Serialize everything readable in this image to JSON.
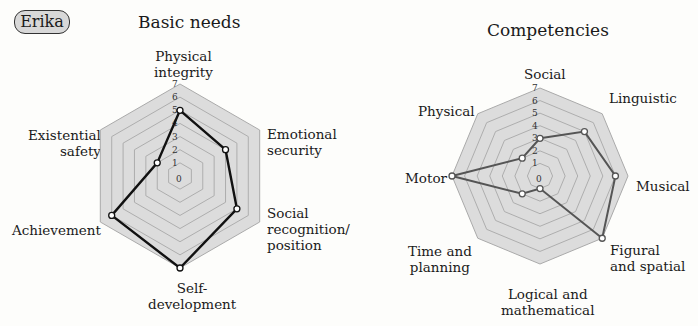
{
  "badge": {
    "label": "Erika"
  },
  "chart_data": [
    {
      "type": "radar",
      "title": "Basic needs",
      "categories": [
        "Physical integrity",
        "Emotional security",
        "Social recognition/ position",
        "Self-development",
        "Achievement",
        "Existential safety"
      ],
      "values": [
        5,
        4,
        5,
        7,
        6,
        2
      ],
      "rlim": [
        0,
        7
      ],
      "ticks": [
        0,
        1,
        2,
        3,
        4,
        5,
        6,
        7
      ],
      "line_color": "#111111",
      "grid": true,
      "legend": null
    },
    {
      "type": "radar",
      "title": "Competencies",
      "categories": [
        "Social",
        "Linguistic",
        "Musical",
        "Figural and spatial",
        "Logical and mathematical",
        "Time and planning",
        "Motor",
        "Physical"
      ],
      "values": [
        3,
        5,
        6,
        7,
        1,
        2,
        7,
        2
      ],
      "rlim": [
        0,
        7
      ],
      "ticks": [
        0,
        1,
        2,
        3,
        4,
        5,
        6,
        7
      ],
      "line_color": "#555555",
      "grid": true,
      "legend": null
    }
  ],
  "left": {
    "title": "Basic needs",
    "labels": {
      "physical": [
        "Physical",
        "integrity"
      ],
      "emotional": [
        "Emotional",
        "security"
      ],
      "social": [
        "Social",
        "recognition/",
        "position"
      ],
      "self": [
        "Self-",
        "development"
      ],
      "achievement": [
        "Achievement"
      ],
      "existential": [
        "Existential",
        "safety"
      ]
    }
  },
  "right": {
    "title": "Competencies",
    "labels": {
      "social": [
        "Social"
      ],
      "linguistic": [
        "Linguistic"
      ],
      "musical": [
        "Musical"
      ],
      "figural": [
        "Figural",
        "and spatial"
      ],
      "logical": [
        "Logical and",
        "mathematical"
      ],
      "time": [
        "Time and",
        "planning"
      ],
      "motor": [
        "Motor"
      ],
      "physical": [
        "Physical"
      ]
    }
  }
}
